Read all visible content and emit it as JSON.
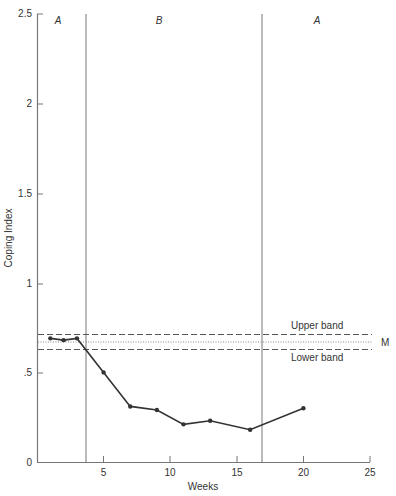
{
  "chart_data": {
    "type": "line",
    "title": "",
    "xlabel": "Weeks",
    "ylabel": "Coping Index",
    "xlim": [
      0,
      25
    ],
    "ylim": [
      0,
      2.5
    ],
    "x_ticks": [
      5,
      10,
      15,
      20,
      25
    ],
    "x_tick_labels": [
      "5",
      "10",
      "15",
      "20",
      "25"
    ],
    "y_ticks": [
      0,
      0.5,
      1,
      1.5,
      2,
      2.5
    ],
    "y_tick_labels": [
      "0",
      ".5",
      "1",
      "1.5",
      "2",
      "2.5"
    ],
    "grid": false,
    "series": [
      {
        "name": "Coping Index",
        "x": [
          1,
          2,
          3,
          5,
          7,
          9,
          11,
          13,
          16,
          20
        ],
        "values": [
          0.69,
          0.68,
          0.69,
          0.5,
          0.31,
          0.29,
          0.21,
          0.23,
          0.18,
          0.3
        ]
      }
    ],
    "phases": [
      {
        "label": "A",
        "start": 0,
        "end": 3.7
      },
      {
        "label": "B",
        "start": 3.7,
        "end": 16.9
      },
      {
        "label": "A",
        "start": 16.9,
        "end": 25
      }
    ],
    "phase_lines_x": [
      3.7,
      16.9
    ],
    "reference_lines": [
      {
        "name": "Upper band",
        "y": 0.72,
        "style": "dashed"
      },
      {
        "name": "M",
        "y": 0.67,
        "style": "dotted"
      },
      {
        "name": "Lower band",
        "y": 0.63,
        "style": "dashed"
      }
    ],
    "annotations": [
      "Upper band",
      "M",
      "Lower band"
    ]
  },
  "labels": {
    "xlabel": "Weeks",
    "ylabel": "Coping Index",
    "phase_a1": "A",
    "phase_b": "B",
    "phase_a2": "A",
    "upper_band": "Upper band",
    "lower_band": "Lower band",
    "mean": "M",
    "y0": "0",
    "y05": ".5",
    "y1": "1",
    "y15": "1.5",
    "y2": "2",
    "y25": "2.5",
    "x5": "5",
    "x10": "10",
    "x15": "15",
    "x20": "20",
    "x25": "25"
  }
}
